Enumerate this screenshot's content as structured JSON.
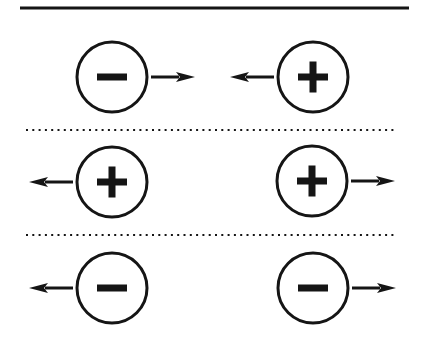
{
  "diagram": {
    "colors": {
      "ink": "#151515",
      "background": "#ffffff"
    },
    "top_rule": {
      "x1": 20,
      "x2": 409,
      "y": 8,
      "thickness": 3
    },
    "dividers": [
      {
        "x1": 26,
        "x2": 397,
        "y": 130
      },
      {
        "x1": 26,
        "x2": 397,
        "y": 235
      }
    ],
    "rows": [
      {
        "name": "opposite-charges-attract",
        "interaction": "attract",
        "charges": [
          {
            "sign": "negative",
            "symbol": "−",
            "cx": 112,
            "cy": 77,
            "arrow": "right"
          },
          {
            "sign": "positive",
            "symbol": "+",
            "cx": 313,
            "cy": 77,
            "arrow": "left"
          }
        ]
      },
      {
        "name": "positive-charges-repel",
        "interaction": "repel",
        "charges": [
          {
            "sign": "positive",
            "symbol": "+",
            "cx": 112,
            "cy": 182,
            "arrow": "left"
          },
          {
            "sign": "positive",
            "symbol": "+",
            "cx": 312,
            "cy": 181,
            "arrow": "right"
          }
        ]
      },
      {
        "name": "negative-charges-repel",
        "interaction": "repel",
        "charges": [
          {
            "sign": "negative",
            "symbol": "−",
            "cx": 112,
            "cy": 288,
            "arrow": "left"
          },
          {
            "sign": "negative",
            "symbol": "−",
            "cx": 313,
            "cy": 288,
            "arrow": "right"
          }
        ]
      }
    ]
  }
}
